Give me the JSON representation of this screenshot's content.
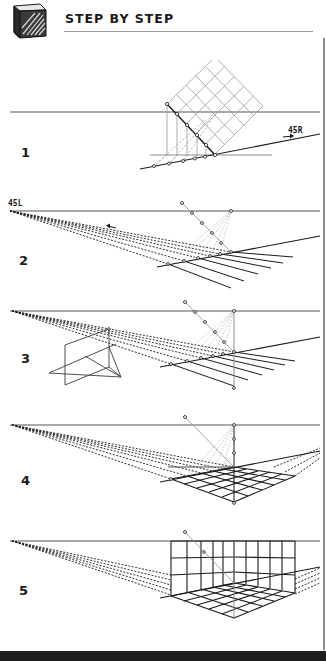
{
  "header": {
    "title": "STEP BY STEP",
    "icon": "sketched-cube-icon"
  },
  "steps": [
    {
      "number": "1",
      "label_tag": "45R",
      "description": "Rotated square grid projected down onto a 45R ground line"
    },
    {
      "number": "2",
      "label_tag": "45L",
      "description": "Lines from 45L vanishing point through marked points form receding lines"
    },
    {
      "number": "3",
      "description": "Measuring plane and vertical measuring line added"
    },
    {
      "number": "4",
      "description": "Floor grid completed in perspective"
    },
    {
      "number": "5",
      "description": "Vertical wall grids raised from floor grid"
    }
  ],
  "colors": {
    "ink": "#1a1a1a",
    "horizon": "#8c8c8c",
    "construction": "#a0a0a0",
    "footer": "#1e1e1e"
  },
  "footer": {
    "text": ""
  }
}
